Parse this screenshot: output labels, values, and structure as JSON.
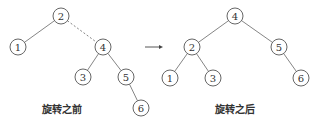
{
  "diagram": {
    "before": {
      "caption": "旋转之前",
      "nodes": [
        {
          "id": "2",
          "label": "2",
          "x": 61,
          "y": 16
        },
        {
          "id": "1",
          "label": "1",
          "x": 18,
          "y": 47
        },
        {
          "id": "4",
          "label": "4",
          "x": 103,
          "y": 47
        },
        {
          "id": "3",
          "label": "3",
          "x": 83,
          "y": 77
        },
        {
          "id": "5",
          "label": "5",
          "x": 126,
          "y": 77
        },
        {
          "id": "6",
          "label": "6",
          "x": 141,
          "y": 108
        }
      ],
      "edges": [
        {
          "from": "2",
          "to": "1",
          "style": "solid"
        },
        {
          "from": "2",
          "to": "4",
          "style": "dashed"
        },
        {
          "from": "4",
          "to": "3",
          "style": "solid"
        },
        {
          "from": "4",
          "to": "5",
          "style": "solid"
        },
        {
          "from": "5",
          "to": "6",
          "style": "solid"
        }
      ]
    },
    "arrow": {
      "x1": 145,
      "y1": 47,
      "x2": 163,
      "y2": 47
    },
    "after": {
      "caption": "旋转之后",
      "nodes": [
        {
          "id": "4",
          "label": "4",
          "x": 235,
          "y": 16
        },
        {
          "id": "2",
          "label": "2",
          "x": 192,
          "y": 47
        },
        {
          "id": "5",
          "label": "5",
          "x": 279,
          "y": 47
        },
        {
          "id": "1",
          "label": "1",
          "x": 170,
          "y": 78
        },
        {
          "id": "3",
          "label": "3",
          "x": 213,
          "y": 78
        },
        {
          "id": "6",
          "label": "6",
          "x": 301,
          "y": 78
        }
      ],
      "edges": [
        {
          "from": "4",
          "to": "2",
          "style": "solid"
        },
        {
          "from": "4",
          "to": "5",
          "style": "solid"
        },
        {
          "from": "2",
          "to": "1",
          "style": "solid"
        },
        {
          "from": "2",
          "to": "3",
          "style": "solid"
        },
        {
          "from": "5",
          "to": "6",
          "style": "solid"
        }
      ]
    }
  }
}
